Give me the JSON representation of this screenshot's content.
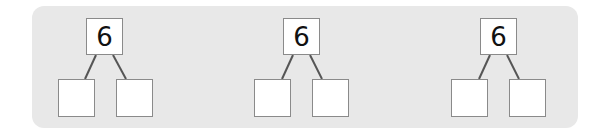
{
  "diagrams": [
    {
      "whole": "6",
      "parts": [
        "",
        ""
      ]
    },
    {
      "whole": "6",
      "parts": [
        "",
        ""
      ]
    },
    {
      "whole": "6",
      "parts": [
        "",
        ""
      ]
    }
  ],
  "colors": {
    "panel": "#e8e8e8",
    "box_border": "#8a8a8a",
    "line": "#555555"
  }
}
